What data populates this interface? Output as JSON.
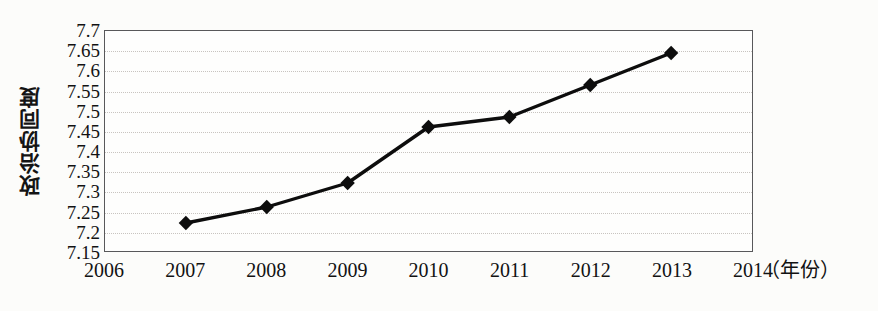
{
  "chart_data": {
    "type": "line",
    "title": "",
    "xlabel": "（年份）",
    "ylabel": "政治协同度",
    "x": [
      2007,
      2008,
      2009,
      2010,
      2011,
      2012,
      2013
    ],
    "values": [
      7.22,
      7.26,
      7.32,
      7.46,
      7.485,
      7.565,
      7.645
    ],
    "series": [
      {
        "name": "政治协同度",
        "values": [
          7.22,
          7.26,
          7.32,
          7.46,
          7.485,
          7.565,
          7.645
        ]
      }
    ],
    "xlim": [
      2006,
      2014
    ],
    "ylim": [
      7.15,
      7.7
    ],
    "x_ticks": [
      "2006",
      "2007",
      "2008",
      "2009",
      "2010",
      "2011",
      "2012",
      "2013",
      "2014"
    ],
    "x_tick_values": [
      2006,
      2007,
      2008,
      2009,
      2010,
      2011,
      2012,
      2013,
      2014
    ],
    "y_ticks": [
      "7.15",
      "7.2",
      "7.25",
      "7.3",
      "7.35",
      "7.4",
      "7.45",
      "7.5",
      "7.55",
      "7.6",
      "7.65",
      "7.7"
    ],
    "y_tick_values": [
      7.15,
      7.2,
      7.25,
      7.3,
      7.35,
      7.4,
      7.45,
      7.5,
      7.55,
      7.6,
      7.65,
      7.7
    ],
    "grid": true,
    "grid_axis": "y",
    "legend": false,
    "legend_position": "none",
    "marker": "diamond",
    "line_color": "#0d0d0d",
    "marker_color": "#0d0d0d",
    "grid_color": "#c8c4c0",
    "axis_color": "#58585a",
    "background_color": "#fcfcfa"
  }
}
